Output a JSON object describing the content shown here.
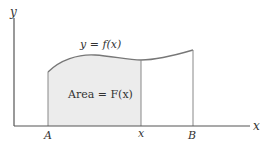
{
  "diagram": {
    "title": "",
    "axes": {
      "x_label": "x",
      "y_label": "y"
    },
    "curve_label": "y = f(x)",
    "area_label": "Area = F(x)",
    "points": {
      "a_label": "A",
      "x_label": "x",
      "b_label": "B"
    },
    "colors": {
      "axis": "#555555",
      "curve": "#777777",
      "shade": "#ececec",
      "text": "#333333"
    }
  }
}
